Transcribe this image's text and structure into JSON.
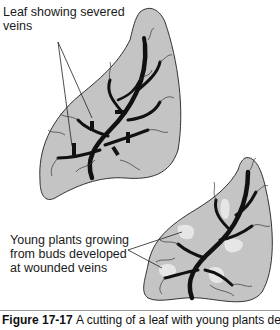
{
  "figure": {
    "labels": {
      "top": [
        "Leaf showing severed",
        "veins"
      ],
      "bottom": [
        "Young plants growing",
        "from buds developed",
        "at wounded veins"
      ]
    },
    "caption": {
      "number": "Figure 17-17",
      "text": "A cutting of a leaf with young plants developing",
      "visible": "partially cut off at bottom edge"
    },
    "colors": {
      "leaf_fill": "#c4c4c4",
      "leaf_outline": "#333333",
      "vein": "#111111",
      "young_plant": "#e6e6e6"
    },
    "leaves": [
      {
        "name": "upper-leaf",
        "description": "Leaf with severed veins"
      },
      {
        "name": "lower-leaf",
        "description": "Leaf with young plants at wounded veins"
      }
    ]
  }
}
